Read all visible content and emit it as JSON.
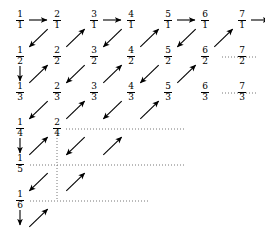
{
  "figure": {
    "type": "diagram",
    "background_color": "#ffffff",
    "ink_color": "#000000",
    "dotted_color": "#777777"
  },
  "grid": {
    "origin_x": 20,
    "origin_y": 20,
    "col_step": 37,
    "row_step": 36,
    "columns": 7,
    "rows": 6,
    "numerators": [
      1,
      2,
      3,
      4,
      5,
      6,
      7
    ],
    "denominators": [
      1,
      2,
      3,
      4,
      5,
      6
    ]
  },
  "cells": [
    {
      "num": "1",
      "den": "1",
      "col": 0,
      "row": 0
    },
    {
      "num": "2",
      "den": "1",
      "col": 1,
      "row": 0
    },
    {
      "num": "3",
      "den": "1",
      "col": 2,
      "row": 0
    },
    {
      "num": "4",
      "den": "1",
      "col": 3,
      "row": 0
    },
    {
      "num": "5",
      "den": "1",
      "col": 4,
      "row": 0
    },
    {
      "num": "6",
      "den": "1",
      "col": 5,
      "row": 0
    },
    {
      "num": "7",
      "den": "1",
      "col": 6,
      "row": 0
    },
    {
      "num": "1",
      "den": "2",
      "col": 0,
      "row": 1
    },
    {
      "num": "2",
      "den": "2",
      "col": 1,
      "row": 1
    },
    {
      "num": "3",
      "den": "2",
      "col": 2,
      "row": 1
    },
    {
      "num": "4",
      "den": "2",
      "col": 3,
      "row": 1
    },
    {
      "num": "5",
      "den": "2",
      "col": 4,
      "row": 1
    },
    {
      "num": "6",
      "den": "2",
      "col": 5,
      "row": 1
    },
    {
      "num": "7",
      "den": "2",
      "col": 6,
      "row": 1
    },
    {
      "num": "1",
      "den": "3",
      "col": 0,
      "row": 2
    },
    {
      "num": "2",
      "den": "3",
      "col": 1,
      "row": 2
    },
    {
      "num": "3",
      "den": "3",
      "col": 2,
      "row": 2
    },
    {
      "num": "4",
      "den": "3",
      "col": 3,
      "row": 2
    },
    {
      "num": "5",
      "den": "3",
      "col": 4,
      "row": 2
    },
    {
      "num": "6",
      "den": "3",
      "col": 5,
      "row": 2
    },
    {
      "num": "7",
      "den": "3",
      "col": 6,
      "row": 2
    },
    {
      "num": "1",
      "den": "4",
      "col": 0,
      "row": 3
    },
    {
      "num": "2",
      "den": "4",
      "col": 1,
      "row": 3
    },
    {
      "num": "1",
      "den": "5",
      "col": 0,
      "row": 4
    },
    {
      "num": "1",
      "den": "6",
      "col": 0,
      "row": 5
    }
  ],
  "horizontal_arrows": [
    {
      "from_col": 0,
      "to_col": 1,
      "row": 0
    },
    {
      "from_col": 2,
      "to_col": 3,
      "row": 0
    },
    {
      "from_col": 4,
      "to_col": 5,
      "row": 0
    },
    {
      "from_col": 6,
      "to_col": 7,
      "row": 0
    }
  ],
  "vertical_arrows": [
    {
      "col": 0,
      "from_row": 1,
      "to_row": 2
    },
    {
      "col": 0,
      "from_row": 3,
      "to_row": 4
    },
    {
      "col": 0,
      "from_row": 5,
      "to_row": 6
    }
  ],
  "diagonal_arrows": [
    {
      "from_col": 1,
      "from_row": 0,
      "to_col": 0,
      "to_row": 1,
      "direction": "down-left"
    },
    {
      "from_col": 0,
      "from_row": 2,
      "to_col": 1,
      "to_row": 1,
      "direction": "up-right"
    },
    {
      "from_col": 1,
      "from_row": 1,
      "to_col": 2,
      "to_row": 0,
      "direction": "up-right"
    },
    {
      "from_col": 3,
      "from_row": 0,
      "to_col": 2,
      "to_row": 1,
      "direction": "down-left"
    },
    {
      "from_col": 2,
      "from_row": 1,
      "to_col": 1,
      "to_row": 2,
      "direction": "down-left"
    },
    {
      "from_col": 1,
      "from_row": 2,
      "to_col": 0,
      "to_row": 3,
      "direction": "down-left"
    },
    {
      "from_col": 0,
      "from_row": 4,
      "to_col": 1,
      "to_row": 3,
      "direction": "up-right"
    },
    {
      "from_col": 1,
      "from_row": 3,
      "to_col": 2,
      "to_row": 2,
      "direction": "up-right"
    },
    {
      "from_col": 2,
      "from_row": 2,
      "to_col": 3,
      "to_row": 1,
      "direction": "up-right"
    },
    {
      "from_col": 3,
      "from_row": 1,
      "to_col": 4,
      "to_row": 0,
      "direction": "up-right"
    },
    {
      "from_col": 5,
      "from_row": 0,
      "to_col": 4,
      "to_row": 1,
      "direction": "down-left"
    },
    {
      "from_col": 4,
      "from_row": 1,
      "to_col": 3,
      "to_row": 2,
      "direction": "down-left"
    },
    {
      "from_col": 3,
      "from_row": 2,
      "to_col": 2,
      "to_row": 3,
      "direction": "down-left"
    },
    {
      "from_col": 2,
      "from_row": 3,
      "to_col": 1,
      "to_row": 4,
      "direction": "down-left"
    },
    {
      "from_col": 1,
      "from_row": 4,
      "to_col": 0,
      "to_row": 5,
      "direction": "down-left"
    },
    {
      "from_col": 0,
      "from_row": 6,
      "to_col": 1,
      "to_row": 5,
      "direction": "up-right"
    },
    {
      "from_col": 1,
      "from_row": 5,
      "to_col": 2,
      "to_row": 4,
      "direction": "up-right"
    },
    {
      "from_col": 2,
      "from_row": 4,
      "to_col": 3,
      "to_row": 3,
      "direction": "up-right"
    },
    {
      "from_col": 3,
      "from_row": 3,
      "to_col": 4,
      "to_row": 2,
      "direction": "up-right"
    },
    {
      "from_col": 4,
      "from_row": 2,
      "to_col": 5,
      "to_row": 1,
      "direction": "up-right"
    },
    {
      "from_col": 5,
      "from_row": 1,
      "to_col": 6,
      "to_row": 0,
      "direction": "up-right"
    }
  ],
  "dotted_lines": [
    {
      "orientation": "horizontal",
      "x1": 222,
      "x2": 258,
      "y": 57
    },
    {
      "orientation": "horizontal",
      "x1": 222,
      "x2": 258,
      "y": 93
    },
    {
      "orientation": "horizontal",
      "x1": 66,
      "x2": 185,
      "y": 129
    },
    {
      "orientation": "horizontal",
      "x1": 30,
      "x2": 185,
      "y": 165
    },
    {
      "orientation": "horizontal",
      "x1": 30,
      "x2": 148,
      "y": 201
    },
    {
      "orientation": "vertical",
      "x": 57,
      "y1": 132,
      "y2": 201
    }
  ]
}
